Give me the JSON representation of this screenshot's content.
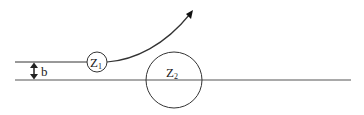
{
  "diagram": {
    "labels": {
      "impact_parameter": "b",
      "particle1": "Z",
      "particle1_sub": "1",
      "particle2": "Z",
      "particle2_sub": "2"
    },
    "colors": {
      "stroke": "#333333",
      "background": "#ffffff"
    }
  }
}
